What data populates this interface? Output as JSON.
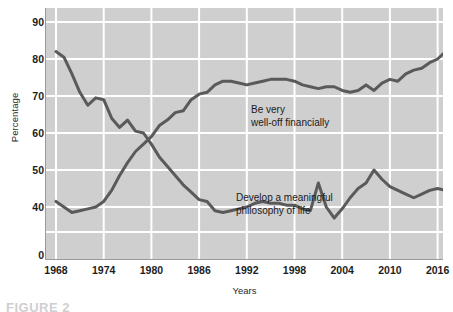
{
  "chart_data": {
    "type": "line",
    "title": "",
    "xlabel": "Years",
    "ylabel": "Percentage",
    "xlim": [
      1968,
      2018
    ],
    "ylim": [
      35,
      92
    ],
    "grid": true,
    "legend_position": "inline-annotations",
    "xticks": [
      1968,
      1974,
      1980,
      1986,
      1992,
      1998,
      2004,
      2010,
      2016
    ],
    "yticks": [
      0,
      40,
      50,
      60,
      70,
      80,
      90
    ],
    "ytick_labels": [
      "0",
      "40",
      "50",
      "60",
      "70",
      "80",
      "90"
    ],
    "y_axis_break_note": "axis jumps from 0 to 40",
    "series": [
      {
        "name": "Develop a meaningful philosophy of life",
        "color": "#5a5a5a",
        "x": [
          1968,
          1969,
          1970,
          1971,
          1972,
          1973,
          1974,
          1975,
          1976,
          1977,
          1978,
          1979,
          1980,
          1981,
          1982,
          1983,
          1984,
          1985,
          1986,
          1987,
          1988,
          1989,
          1990,
          1991,
          1992,
          1993,
          1994,
          1995,
          1996,
          1997,
          1998,
          1999,
          2000,
          2001,
          2002,
          2003,
          2004,
          2005,
          2006,
          2007,
          2008,
          2009,
          2010,
          2011,
          2012,
          2013,
          2014,
          2015,
          2016,
          2017,
          2018
        ],
        "values": [
          82.0,
          80.5,
          76.0,
          71.0,
          67.5,
          69.5,
          69.0,
          64.0,
          61.5,
          63.5,
          60.5,
          60.0,
          57.0,
          53.5,
          51.0,
          48.5,
          46.0,
          44.0,
          42.0,
          41.5,
          39.0,
          38.5,
          39.0,
          39.5,
          40.0,
          41.0,
          41.5,
          41.0,
          41.0,
          40.5,
          40.5,
          39.5,
          39.0,
          46.5,
          40.0,
          37.0,
          39.5,
          42.5,
          45.0,
          46.5,
          50.0,
          47.5,
          45.5,
          44.5,
          43.5,
          42.5,
          43.5,
          44.5,
          45.0,
          44.5,
          48.0
        ]
      },
      {
        "name": "Be very well-off financially",
        "color": "#5a5a5a",
        "x": [
          1968,
          1969,
          1970,
          1971,
          1972,
          1973,
          1974,
          1975,
          1976,
          1977,
          1978,
          1979,
          1980,
          1981,
          1982,
          1983,
          1984,
          1985,
          1986,
          1987,
          1988,
          1989,
          1990,
          1991,
          1992,
          1993,
          1994,
          1995,
          1996,
          1997,
          1998,
          1999,
          2000,
          2001,
          2002,
          2003,
          2004,
          2005,
          2006,
          2007,
          2008,
          2009,
          2010,
          2011,
          2012,
          2013,
          2014,
          2015,
          2016,
          2017,
          2018
        ],
        "values": [
          41.5,
          40.0,
          38.5,
          39.0,
          39.5,
          40.0,
          41.5,
          44.5,
          48.5,
          52.0,
          55.0,
          57.0,
          59.0,
          62.0,
          63.5,
          65.5,
          66.0,
          69.0,
          70.5,
          71.0,
          73.0,
          74.0,
          74.0,
          73.5,
          73.0,
          73.5,
          74.0,
          74.5,
          74.5,
          74.5,
          74.0,
          73.0,
          72.5,
          72.0,
          72.5,
          72.5,
          71.5,
          71.0,
          71.5,
          73.0,
          71.5,
          73.5,
          74.5,
          74.0,
          76.0,
          77.0,
          77.5,
          79.0,
          80.0,
          82.0,
          81.0
        ]
      }
    ],
    "annotations": [
      {
        "id": "welloff",
        "text": "Be very\nwell-off financially",
        "x": 1988,
        "y": 68
      },
      {
        "id": "philosophy",
        "text": "Develop a meaningful\nphilosophy of life",
        "x": 1986,
        "y": 47
      }
    ]
  },
  "axes": {
    "y_title": "Percentage",
    "x_title": "Years",
    "ytick_labels": [
      "90",
      "80",
      "70",
      "60",
      "50",
      "40",
      "0"
    ],
    "xtick_labels": [
      "1968",
      "1974",
      "1980",
      "1986",
      "1992",
      "1998",
      "2004",
      "2010",
      "2016"
    ]
  },
  "annotations": {
    "welloff_line1": "Be very",
    "welloff_line2": "well-off financially",
    "philosophy_line1": "Develop a meaningful",
    "philosophy_line2": "philosophy of life"
  },
  "caption": {
    "text": "FIGURE 2"
  },
  "colors": {
    "plot_background": "#cfcfcf",
    "gridline": "#ffffff",
    "line": "#5a5a5a",
    "text": "#1a1a1a",
    "page_background": "#ffffff"
  }
}
